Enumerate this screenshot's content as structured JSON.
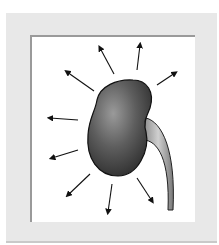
{
  "illustration": {
    "subject": "kidney-with-ureter",
    "arrow_count": 10,
    "colors": {
      "frame": "#e8e8e8",
      "panel": "#ffffff",
      "kidney_dark": "#3a3a3a",
      "kidney_light": "#8a8a8a",
      "ureter": "#b8b8b8",
      "arrow": "#111111"
    }
  }
}
